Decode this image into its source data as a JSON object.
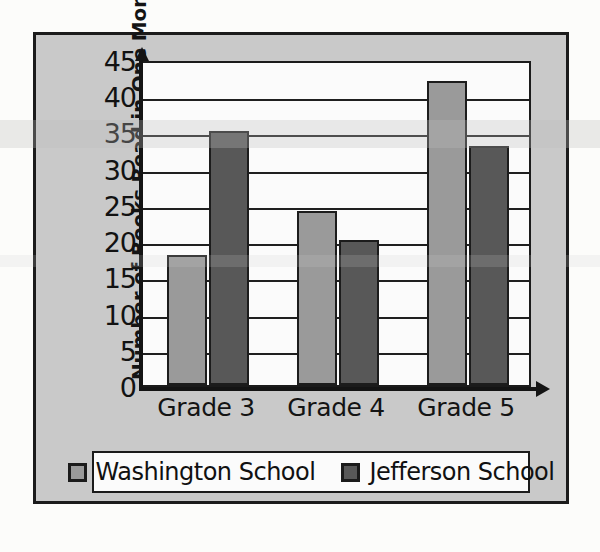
{
  "chart_data": {
    "type": "bar",
    "title": "",
    "xlabel": "",
    "ylabel": "Number of Books Read in One Month",
    "categories": [
      "Grade 3",
      "Grade 4",
      "Grade 5"
    ],
    "series": [
      {
        "name": "Washington School",
        "color": "#9a9a9a",
        "values": [
          18,
          24,
          42
        ]
      },
      {
        "name": "Jefferson School",
        "color": "#585858",
        "values": [
          35,
          20,
          33
        ]
      }
    ],
    "ylim": [
      0,
      45
    ],
    "ytick_labels": [
      "0",
      "5",
      "10",
      "15",
      "20",
      "25",
      "30",
      "35",
      "40",
      "45"
    ],
    "ytick_values": [
      0,
      5,
      10,
      15,
      20,
      25,
      30,
      35,
      40,
      45
    ],
    "grid": true,
    "legend_position": "bottom"
  },
  "legend": {
    "items": [
      {
        "label": "Washington School",
        "swatch": "#9a9a9a"
      },
      {
        "label": "Jefferson School",
        "swatch": "#585858"
      }
    ]
  },
  "colors": {
    "figure_background": "#c9c9c9",
    "plot_background": "#fbfbfb",
    "frame": "#1b1b1b",
    "axis": "#141414",
    "washington": "#9a9a9a",
    "jefferson": "#585858"
  }
}
